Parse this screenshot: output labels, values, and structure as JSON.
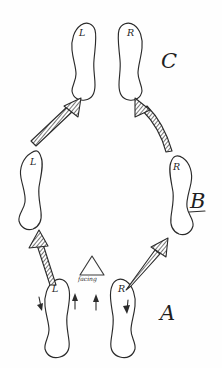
{
  "diagram": {
    "medium": "hand-drawn pen on paper",
    "background_color": "#fefefe",
    "ink_color": "#2b2b2b",
    "stage_labels": [
      {
        "id": "A",
        "text": "A",
        "underlined": false
      },
      {
        "id": "B",
        "text": "B",
        "underlined": true
      },
      {
        "id": "C",
        "text": "C",
        "underlined": false
      }
    ],
    "footprints": [
      {
        "id": "top-left",
        "label": "L",
        "stage": "C",
        "side": "left"
      },
      {
        "id": "top-right",
        "label": "R",
        "stage": "C",
        "side": "right"
      },
      {
        "id": "mid-left",
        "label": "L",
        "stage": "B",
        "side": "left"
      },
      {
        "id": "mid-right",
        "label": "R",
        "stage": "B",
        "side": "right"
      },
      {
        "id": "bottom-left",
        "label": "L",
        "stage": "A",
        "side": "left"
      },
      {
        "id": "bottom-right",
        "label": "R",
        "stage": "A",
        "side": "right"
      }
    ],
    "facing_marker": {
      "shape": "triangle",
      "label": "facing",
      "direction": "up"
    },
    "motion_arrows": [
      {
        "id": "arrow-a-to-b-left",
        "from": "bottom-left",
        "to": "mid-left",
        "style": "hatched",
        "direction": "up-left"
      },
      {
        "id": "arrow-a-to-b-right",
        "from": "bottom-right",
        "to": "mid-right",
        "style": "hatched",
        "direction": "up-right"
      },
      {
        "id": "arrow-b-to-c-left",
        "from": "mid-left",
        "to": "top-left",
        "style": "hatched",
        "direction": "up-right"
      },
      {
        "id": "arrow-b-to-c-right",
        "from": "mid-right",
        "to": "top-right",
        "style": "hatched",
        "direction": "up-left"
      }
    ],
    "pivot_arrows": [
      {
        "id": "pivot-inner-left",
        "direction": "up",
        "near": "bottom-left"
      },
      {
        "id": "pivot-inner-right",
        "direction": "up",
        "near": "bottom-right"
      },
      {
        "id": "pivot-outer-left",
        "direction": "down",
        "near": "bottom-left"
      },
      {
        "id": "pivot-outer-right",
        "direction": "down",
        "near": "bottom-right"
      }
    ]
  }
}
